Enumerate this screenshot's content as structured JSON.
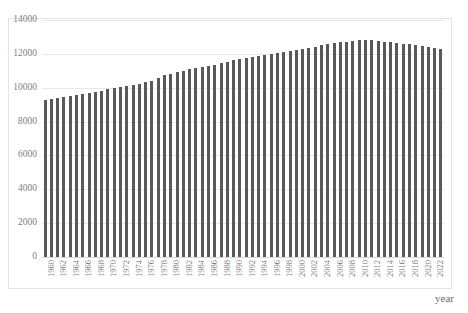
{
  "chart_data": {
    "type": "bar",
    "title": "",
    "xlabel": "year",
    "ylabel": "",
    "ylim": [
      0,
      14000
    ],
    "ytick_step": 2000,
    "yticks": [
      "0",
      "2000",
      "4000",
      "6000",
      "8000",
      "10000",
      "12000",
      "14000"
    ],
    "grid": true,
    "legend": false,
    "bar_color": "#595959",
    "gridline_color": "#e8e8e8",
    "frame_color": "#e3e3e3",
    "label_color": "#808080",
    "xtick_interval": 2,
    "xtick_labels": [
      "1960",
      "1962",
      "1964",
      "1966",
      "1968",
      "1970",
      "1972",
      "1974",
      "1976",
      "1978",
      "1980",
      "1982",
      "1984",
      "1986",
      "1988",
      "1990",
      "1992",
      "1994",
      "1996",
      "1998",
      "2000",
      "2002",
      "2004",
      "2006",
      "2008",
      "2010",
      "2012",
      "2014",
      "2016",
      "2018",
      "2020",
      "2022"
    ],
    "categories": [
      "1960",
      "1961",
      "1962",
      "1963",
      "1964",
      "1965",
      "1966",
      "1967",
      "1968",
      "1969",
      "1970",
      "1971",
      "1972",
      "1973",
      "1974",
      "1975",
      "1976",
      "1977",
      "1978",
      "1979",
      "1980",
      "1981",
      "1982",
      "1983",
      "1984",
      "1985",
      "1986",
      "1987",
      "1988",
      "1989",
      "1990",
      "1991",
      "1992",
      "1993",
      "1994",
      "1995",
      "1996",
      "1997",
      "1998",
      "1999",
      "2000",
      "2001",
      "2002",
      "2003",
      "2004",
      "2005",
      "2006",
      "2007",
      "2008",
      "2009",
      "2010",
      "2011",
      "2012",
      "2013",
      "2014",
      "2015",
      "2016",
      "2017",
      "2018",
      "2019",
      "2020",
      "2021",
      "2022",
      "2023"
    ],
    "values": [
      9300,
      9350,
      9400,
      9460,
      9520,
      9580,
      9640,
      9700,
      9760,
      9830,
      9900,
      9960,
      10030,
      10110,
      10180,
      10240,
      10320,
      10400,
      10560,
      10740,
      10820,
      10900,
      11000,
      11080,
      11140,
      11200,
      11260,
      11340,
      11440,
      11540,
      11620,
      11680,
      11740,
      11800,
      11860,
      11920,
      12000,
      12060,
      12120,
      12180,
      12240,
      12300,
      12360,
      12420,
      12500,
      12560,
      12620,
      12680,
      12720,
      12760,
      12790,
      12800,
      12790,
      12760,
      12720,
      12680,
      12640,
      12600,
      12560,
      12520,
      12440,
      12380,
      12320,
      12280
    ]
  }
}
